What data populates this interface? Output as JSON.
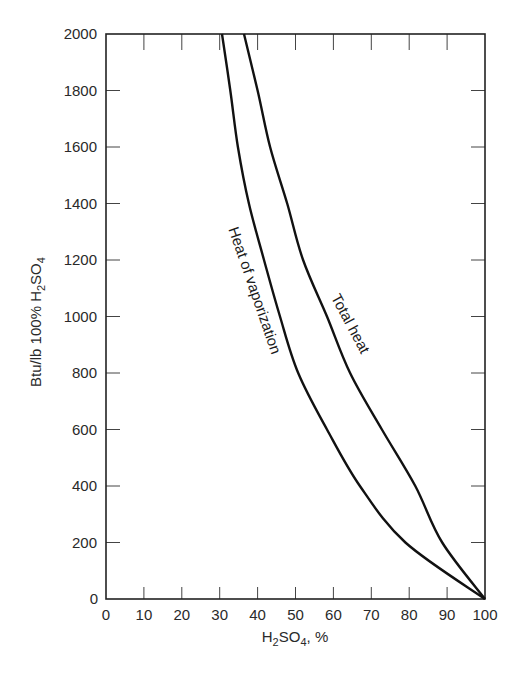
{
  "chart_data": {
    "type": "line",
    "title": "",
    "xlabel": "H2SO4, %",
    "xlabel_parts": {
      "pre": "H",
      "sub1": "2",
      "mid": "SO",
      "sub2": "4",
      "post": ", %"
    },
    "ylabel": "Btu/lb 100% H2SO4",
    "ylabel_parts": {
      "pre": "Btu/lb 100% H",
      "sub1": "2",
      "mid": "SO",
      "sub2": "4"
    },
    "xlim": [
      0,
      100
    ],
    "ylim": [
      0,
      2000
    ],
    "xticks": [
      0,
      10,
      20,
      30,
      40,
      50,
      60,
      70,
      80,
      90,
      100
    ],
    "yticks": [
      0,
      200,
      400,
      600,
      800,
      1000,
      1200,
      1400,
      1600,
      1800,
      2000
    ],
    "grid": false,
    "legend": "inline curve labels",
    "series": [
      {
        "name": "Heat of vaporization",
        "x": [
          30.6,
          32.8,
          34.8,
          37.7,
          41.7,
          45.9,
          50.7,
          58.3,
          67.0,
          79.0,
          100.0
        ],
        "y": [
          2000,
          1800,
          1600,
          1400,
          1200,
          1000,
          800,
          600,
          400,
          200,
          0
        ]
      },
      {
        "name": "Total heat",
        "x": [
          36.4,
          40.0,
          43.3,
          47.8,
          52.0,
          58.3,
          64.4,
          72.8,
          81.6,
          88.7,
          100.0
        ],
        "y": [
          2000,
          1800,
          1600,
          1400,
          1200,
          1000,
          800,
          600,
          400,
          200,
          0
        ]
      }
    ],
    "annotations": [
      {
        "text": "Heat of vaporization",
        "series": 0
      },
      {
        "text": "Total heat",
        "series": 1
      }
    ]
  },
  "style": {
    "line_color": "#111111",
    "axis_color": "#222222",
    "background": "#ffffff"
  }
}
